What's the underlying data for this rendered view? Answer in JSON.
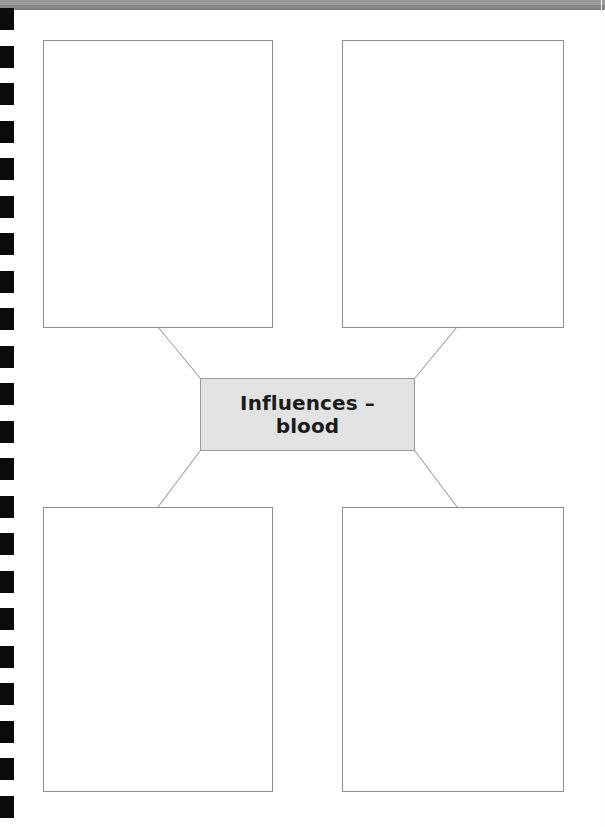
{
  "page": {
    "width": 605,
    "height": 827,
    "background_color": "#ffffff",
    "top_band_color": "#8b8b8b"
  },
  "binding": {
    "name": "spiral-binding-holes",
    "hole_color": "#0b0b0b",
    "hole_count": 22,
    "hole_width": 14,
    "hole_height": 22,
    "hole_spacing": 37.5,
    "first_hole_y": 8
  },
  "diagram": {
    "type": "graphic-organizer",
    "center": {
      "label": "Influences –\nblood",
      "label_line_1": "Influences –",
      "label_line_2": "blood",
      "fill_color": "#e3e3e3",
      "border_color": "#9a9a9a",
      "text_color": "#1b1b1b",
      "x": 200,
      "y": 378,
      "width": 215,
      "height": 73
    },
    "boxes": [
      {
        "id": "top-left",
        "content": "",
        "fill_color": "#ffffff",
        "border_color": "#8d8d8d",
        "x": 43,
        "y": 40,
        "width": 230,
        "height": 288
      },
      {
        "id": "top-right",
        "content": "",
        "fill_color": "#ffffff",
        "border_color": "#8d8d8d",
        "x": 342,
        "y": 40,
        "width": 222,
        "height": 288
      },
      {
        "id": "bottom-left",
        "content": "",
        "fill_color": "#ffffff",
        "border_color": "#8d8d8d",
        "x": 43,
        "y": 507,
        "width": 230,
        "height": 285
      },
      {
        "id": "bottom-right",
        "content": "",
        "fill_color": "#ffffff",
        "border_color": "#8d8d8d",
        "x": 342,
        "y": 507,
        "width": 222,
        "height": 285
      }
    ],
    "connectors": [
      {
        "id": "center-to-top-left",
        "from_x": 200,
        "from_y": 378,
        "to_x": 158,
        "to_y": 327
      },
      {
        "id": "center-to-top-right",
        "from_x": 415,
        "from_y": 378,
        "to_x": 457,
        "to_y": 327
      },
      {
        "id": "center-to-bottom-left",
        "from_x": 200,
        "from_y": 451,
        "to_x": 158,
        "to_y": 507
      },
      {
        "id": "center-to-bottom-right",
        "from_x": 415,
        "from_y": 451,
        "to_x": 457,
        "to_y": 507
      }
    ],
    "connector_color": "#8d8d8d"
  }
}
